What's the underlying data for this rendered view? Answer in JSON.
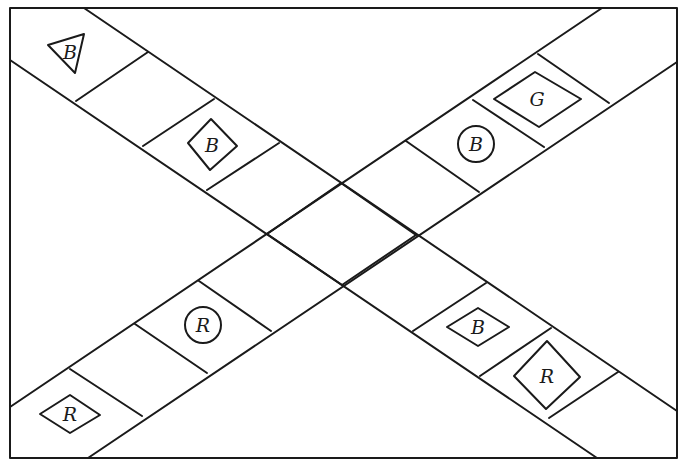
{
  "diagram": {
    "type": "crossing-track-board",
    "border": {
      "x1": 10,
      "y1": 8,
      "x2": 677,
      "y2": 458
    },
    "bands": [
      {
        "name": "descending-band",
        "edges": [
          [
            84,
            8,
            677,
            411
          ],
          [
            10,
            60,
            597,
            458
          ]
        ],
        "dividers": [
          [
            76,
            101,
            148,
            52
          ],
          [
            143,
            146,
            214,
            99
          ],
          [
            207,
            190,
            279,
            143
          ],
          [
            267,
            234,
            341,
            183
          ],
          [
            342,
            285,
            416,
            235
          ],
          [
            413,
            331,
            486,
            283
          ],
          [
            480,
            376,
            551,
            328
          ],
          [
            549,
            418,
            618,
            372
          ]
        ]
      },
      {
        "name": "ascending-band",
        "edges": [
          [
            602,
            8,
            10,
            407
          ],
          [
            677,
            62,
            88,
            458
          ]
        ],
        "dividers": [
          [
            538,
            54,
            609,
            103
          ],
          [
            473,
            100,
            544,
            147
          ],
          [
            406,
            141,
            479,
            192
          ],
          [
            341,
            183,
            416,
            235
          ],
          [
            267,
            234,
            342,
            285
          ],
          [
            199,
            281,
            271,
            331
          ],
          [
            135,
            324,
            207,
            373
          ],
          [
            70,
            369,
            142,
            416
          ]
        ]
      }
    ],
    "pieces": [
      {
        "name": "triangle-piece-b",
        "shape": "triangle",
        "label": "B",
        "points": "48,45 84,34 75,73",
        "label_x": 70,
        "label_y": 52
      },
      {
        "name": "diamond-piece-b-upper",
        "shape": "diamond",
        "label": "B",
        "points": "188,143 211,119 237,146 210,170",
        "label_x": 212,
        "label_y": 145
      },
      {
        "name": "diamond-piece-g",
        "shape": "diamond",
        "label": "G",
        "points": "494,99 535,72 581,99 539,127",
        "label_x": 537,
        "label_y": 99
      },
      {
        "name": "circle-piece-b",
        "shape": "circle",
        "label": "B",
        "cx": 476,
        "cy": 144,
        "r": 18
      },
      {
        "name": "circle-piece-r",
        "shape": "circle",
        "label": "R",
        "cx": 203,
        "cy": 325,
        "r": 18
      },
      {
        "name": "diamond-piece-r-lower-left",
        "shape": "diamond",
        "label": "R",
        "points": "40,414 70,395 100,415 70,433",
        "label_x": 70,
        "label_y": 414
      },
      {
        "name": "diamond-piece-b-lower",
        "shape": "diamond",
        "label": "B",
        "points": "447,327 478,308 509,327 478,346",
        "label_x": 478,
        "label_y": 327
      },
      {
        "name": "diamond-piece-r-lower-right",
        "shape": "diamond",
        "label": "R",
        "points": "514,376 547,341 580,377 546,409",
        "label_x": 547,
        "label_y": 376
      }
    ]
  }
}
